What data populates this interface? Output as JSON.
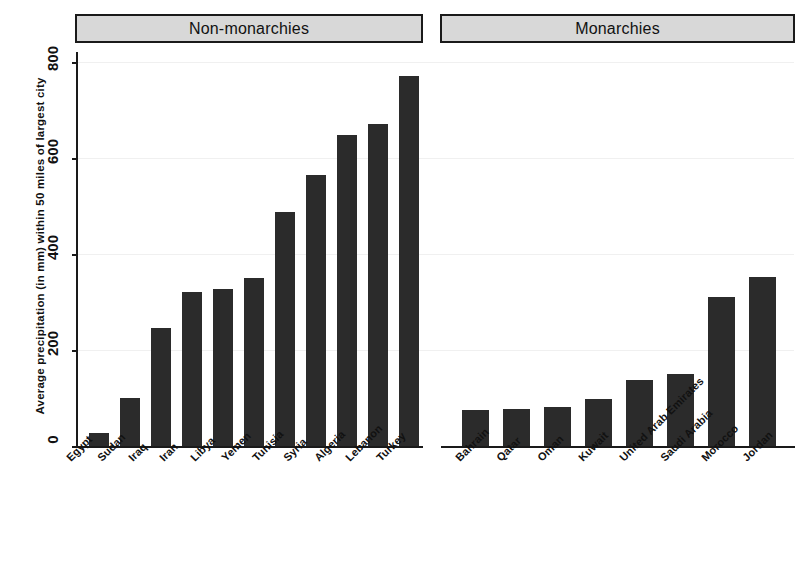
{
  "chart_data": {
    "type": "bar",
    "title": "",
    "xlabel": "",
    "ylabel": "Average precipitation (in mm) within 50 miles of largest city",
    "ylim": [
      0,
      850
    ],
    "yticks": [
      0,
      200,
      400,
      600,
      800
    ],
    "ytick_labels": [
      "0",
      "200",
      "400",
      "600",
      "800"
    ],
    "grid": true,
    "legend": "none",
    "panels": [
      {
        "header": "Non-monarchies",
        "categories": [
          "Egypt",
          "Sudan",
          "Iraq",
          "Iran",
          "Libya",
          "Yemen",
          "Tunisia",
          "Syria",
          "Algeria",
          "Lebanon",
          "Turkey"
        ],
        "values": [
          28,
          100,
          245,
          320,
          328,
          350,
          487,
          565,
          648,
          670,
          770
        ]
      },
      {
        "header": "Monarchies",
        "categories": [
          "Bahrain",
          "Qatar",
          "Oman",
          "Kuwait",
          "United Arab Emirates",
          "Saudi Arabia",
          "Morocco",
          "Jordan"
        ],
        "values": [
          75,
          78,
          82,
          97,
          138,
          150,
          310,
          352
        ]
      }
    ],
    "bar_color": "#2b2b2b",
    "panel_header_color": "#d8d8d8",
    "axis_color": "#1a1a1a"
  }
}
